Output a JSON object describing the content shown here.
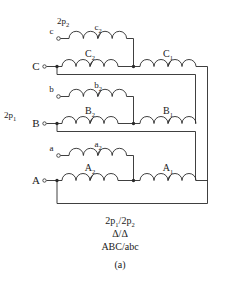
{
  "figure": {
    "label": "(a)",
    "caption_lines": [
      "2p₁/2p₂",
      "Δ/Δ",
      "ABC/abc"
    ],
    "pole_labels": {
      "secondary": "2p₂",
      "primary": "2p₁"
    },
    "type": "transformer-winding-connection-diagram",
    "colors": {
      "background": "#ffffff",
      "wire": "#2a2a2a",
      "text": "#1a1a1a"
    }
  },
  "terminals": {
    "primary": [
      {
        "name": "C",
        "label": "C"
      },
      {
        "name": "B",
        "label": "B"
      },
      {
        "name": "A",
        "label": "A"
      }
    ],
    "secondary": [
      {
        "name": "c",
        "label": "c"
      },
      {
        "name": "b",
        "label": "b"
      },
      {
        "name": "a",
        "label": "a"
      }
    ]
  },
  "windings": {
    "primary": [
      {
        "name": "C2",
        "base": "C",
        "sub": "2"
      },
      {
        "name": "C1",
        "base": "C",
        "sub": "1"
      },
      {
        "name": "B2",
        "base": "B",
        "sub": "2"
      },
      {
        "name": "B1",
        "base": "B",
        "sub": "1"
      },
      {
        "name": "A2",
        "base": "A",
        "sub": "2"
      },
      {
        "name": "A1",
        "base": "A",
        "sub": "1"
      }
    ],
    "secondary": [
      {
        "name": "c2",
        "base": "c",
        "sub": "2"
      },
      {
        "name": "b2",
        "base": "b",
        "sub": "2"
      },
      {
        "name": "a2",
        "base": "a",
        "sub": "2"
      }
    ]
  },
  "pole_sub": {
    "p2_base": "2p",
    "p2_sub": "2",
    "p1_base": "2p",
    "p1_sub": "1"
  }
}
